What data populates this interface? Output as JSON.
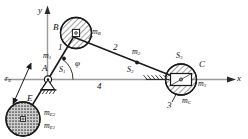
{
  "figure": {
    "type": "mechanism-kinematic-diagram",
    "ink_color": "#1a1a1a",
    "axis_color": "#9a9a9a",
    "hatch_color": "#333333"
  },
  "axes": {
    "x_label": "x",
    "y_label": "y",
    "origin_label": "A"
  },
  "links": [
    {
      "id": "1",
      "label": "1",
      "mass_label": "m",
      "mass_sub": "1"
    },
    {
      "id": "2",
      "label": "2",
      "mass_label": "m",
      "mass_sub": "2"
    },
    {
      "id": "3",
      "label": "3",
      "mass_label": "m",
      "mass_sub": "3"
    },
    {
      "id": "4",
      "label": "4",
      "mass_label": "",
      "mass_sub": ""
    }
  ],
  "joints": {
    "a": "A",
    "b": "B",
    "c": "C",
    "e": "E"
  },
  "centers_of_mass": [
    {
      "label": "S",
      "sub": "1"
    },
    {
      "label": "S",
      "sub": "2"
    },
    {
      "label": "S",
      "sub": "3"
    }
  ],
  "masses": {
    "m1": {
      "base": "m",
      "sub": "1"
    },
    "m2": {
      "base": "m",
      "sub": "2"
    },
    "m3": {
      "base": "m",
      "sub": "3"
    },
    "mB": {
      "base": "m",
      "sub": "B"
    },
    "mC": {
      "base": "m",
      "sub": "C"
    },
    "mE1": {
      "base": "m",
      "sub": "E1"
    },
    "mE2": {
      "base": "m",
      "sub": "E2"
    }
  },
  "dimensions": {
    "rE": {
      "base": "r",
      "sub": "E"
    }
  },
  "angles": {
    "phi": "φ"
  },
  "link_numbers": {
    "one": "1",
    "two": "2",
    "three": "3",
    "four": "4"
  }
}
